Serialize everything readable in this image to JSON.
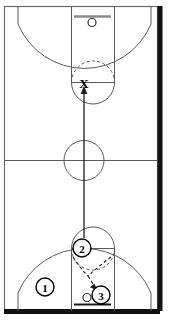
{
  "diagram": {
    "court_type": "full-court",
    "orientation": "vertical",
    "background_color": "#ffffff",
    "line_color": "#5a5a5a",
    "mark_color": "#000000",
    "boundary_accent_color": "#111111"
  },
  "court": {
    "left": 4,
    "right": 158,
    "top": 6,
    "bottom": 311,
    "halfcourt_y": 160,
    "center_circle_radius": 20,
    "lane_left": 71,
    "lane_right": 114,
    "top_lane_bottom_y": 82,
    "bottom_lane_top_y": 240,
    "three_point_radius": 68
  },
  "markers": [
    {
      "id": "offense-1",
      "type": "offense",
      "label": "1",
      "shape": "circle",
      "x": 45,
      "y": 287,
      "radius": 9,
      "description": "Offensive player 1 positioned left wing / corner outside the lane"
    },
    {
      "id": "offense-2",
      "type": "offense",
      "label": "2",
      "shape": "circle",
      "x": 82,
      "y": 248,
      "radius": 9,
      "description": "Offensive player 2 positioned at the free throw line elbow"
    },
    {
      "id": "offense-3",
      "type": "offense",
      "label": "3",
      "shape": "circle",
      "x": 101,
      "y": 295,
      "radius": 9,
      "description": "Offensive player 3 positioned low near the basket"
    },
    {
      "id": "defense-x",
      "type": "defense",
      "label": "X",
      "shape": "letter",
      "x": 84,
      "y": 83,
      "description": "Defender X marked at the far-end free throw line"
    }
  ],
  "movements": [
    {
      "id": "cut-to-far-end",
      "style": "solid",
      "arrow": true,
      "from": {
        "x": 84,
        "y": 237
      },
      "to": {
        "x": 84,
        "y": 90
      },
      "description": "Long solid cut line running up the middle of the court to defender X"
    },
    {
      "id": "screen-left-branch",
      "style": "dashed",
      "arrow": false,
      "from": {
        "x": 74,
        "y": 258
      },
      "to": {
        "x": 88,
        "y": 276
      },
      "description": "Dashed path from left lane area toward the middle"
    },
    {
      "id": "screen-right-branch",
      "style": "dashed",
      "arrow": false,
      "from": {
        "x": 110,
        "y": 258
      },
      "to": {
        "x": 88,
        "y": 276
      },
      "description": "Dashed path from right lane area toward the middle"
    },
    {
      "id": "pass-to-three",
      "style": "dashed",
      "arrow": true,
      "from": {
        "x": 88,
        "y": 276
      },
      "to": {
        "x": 96,
        "y": 289
      },
      "description": "Dashed arrow directed down to offensive player 3"
    }
  ],
  "baskets": [
    {
      "id": "top-basket",
      "backboard_y": 16,
      "backboard_x1": 74,
      "backboard_x2": 111,
      "hoop_x": 92,
      "hoop_y": 23,
      "hoop_radius": 4
    },
    {
      "id": "bottom-basket",
      "backboard_y": 305,
      "backboard_x1": 74,
      "backboard_x2": 111,
      "hoop_x": 87,
      "hoop_y": 297,
      "hoop_radius": 4
    }
  ],
  "icons": {
    "offense_marker": "numbered-circle-icon",
    "defense_marker": "x-letter-icon",
    "hoop": "basketball-hoop-icon",
    "backboard": "backboard-icon",
    "arrow": "arrowhead-icon"
  }
}
